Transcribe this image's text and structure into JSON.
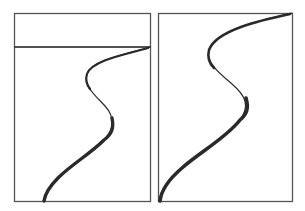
{
  "figure": {
    "colors": {
      "background": "#ffffff",
      "frame": "#555555",
      "curve": "#2a2a2a",
      "divider": "#1a1a1a"
    },
    "panels": [
      {
        "id": "left",
        "frame": {
          "x": 14,
          "y": 13,
          "width": 136,
          "height": 188
        },
        "divider_line_y": 47,
        "curve": {
          "start": [
            150,
            47
          ],
          "leftmost": [
            87,
            78
          ],
          "rightmost": [
            112,
            122
          ],
          "end": [
            44,
            201
          ]
        }
      },
      {
        "id": "right",
        "frame": {
          "x": 158,
          "y": 13,
          "width": 134,
          "height": 188
        },
        "divider_line_y": null,
        "curve": {
          "start": [
            292,
            13
          ],
          "leftmost": [
            209,
            53
          ],
          "rightmost": [
            247,
            103
          ],
          "end": [
            160,
            201
          ]
        }
      }
    ]
  }
}
